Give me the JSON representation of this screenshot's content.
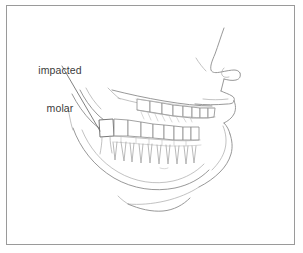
{
  "figure": {
    "background_color": "#ffffff",
    "frame": {
      "visible": true,
      "color": "#9a9a9a",
      "x": 6,
      "y": 5,
      "width": 289,
      "height": 240
    },
    "line_color": "#8c8c8c",
    "label_color": "#3b3b3b"
  },
  "annotation": {
    "label_line_1": "impacted",
    "label_line_2": "molar",
    "leader": {
      "start_x": 62,
      "start_y": 66,
      "end_x": 100,
      "end_y": 131
    }
  },
  "illustration": {
    "view": "lateral-profile-right-facing",
    "subject": "human head lower face, maxilla, mandible and dentition",
    "features": [
      "nose-profile",
      "nostril",
      "upper-lip",
      "lower-lip",
      "chin",
      "mandible-body",
      "mandible-ramus",
      "maxillary-dental-arch",
      "mandibular-dental-arch",
      "tooth-roots",
      "impacted-third-molar"
    ],
    "upper_teeth_count": 8,
    "lower_teeth_count": 9
  }
}
